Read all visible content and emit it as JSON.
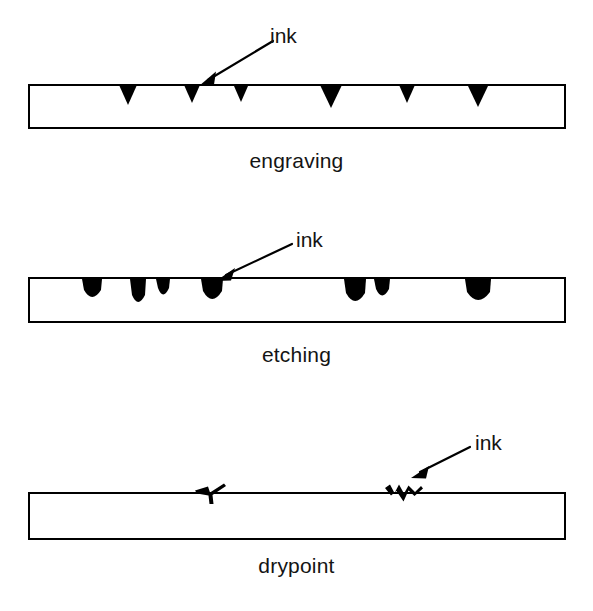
{
  "figure": {
    "background_color": "#ffffff",
    "line_color": "#000000",
    "ink_color": "#000000",
    "text_color": "#141414"
  },
  "panels": [
    {
      "id": "engraving",
      "caption": "engraving",
      "ink_label": "ink",
      "plate": {
        "x": 29,
        "y": 85,
        "width": 536,
        "height": 43,
        "stroke": 2
      },
      "mark_type": "v-groove",
      "mark_description": "sharp clean V-shaped incised grooves filled with ink",
      "marks": [
        {
          "cx": 128,
          "width": 17,
          "depth": 19
        },
        {
          "cx": 192,
          "width": 15,
          "depth": 17
        },
        {
          "cx": 241,
          "width": 14,
          "depth": 16
        },
        {
          "cx": 331,
          "width": 21,
          "depth": 22
        },
        {
          "cx": 407,
          "width": 15,
          "depth": 17
        },
        {
          "cx": 478,
          "width": 20,
          "depth": 21
        }
      ],
      "arrow": {
        "x1": 273,
        "y1": 41,
        "x2": 199,
        "y2": 86
      }
    },
    {
      "id": "etching",
      "caption": "etching",
      "ink_label": "ink",
      "plate": {
        "x": 29,
        "y": 78,
        "width": 536,
        "height": 44,
        "stroke": 2
      },
      "mark_type": "rounded-bite",
      "mark_description": "irregular rounded acid-bitten pits of varying width and depth filled with ink",
      "marks": [
        {
          "cx": 92,
          "width": 20,
          "depth": 23
        },
        {
          "cx": 138,
          "width": 16,
          "depth": 28
        },
        {
          "cx": 163,
          "width": 14,
          "depth": 20
        },
        {
          "cx": 212,
          "width": 22,
          "depth": 25
        },
        {
          "cx": 355,
          "width": 22,
          "depth": 27
        },
        {
          "cx": 382,
          "width": 16,
          "depth": 21
        },
        {
          "cx": 478,
          "width": 26,
          "depth": 26
        }
      ],
      "arrow": {
        "x1": 292,
        "y1": 44,
        "x2": 216,
        "y2": 81
      }
    },
    {
      "id": "drypoint",
      "caption": "drypoint",
      "ink_label": "ink",
      "plate": {
        "x": 29,
        "y": 93,
        "width": 536,
        "height": 46,
        "stroke": 2
      },
      "mark_type": "burr-scratch",
      "mark_description": "shallow scratched lines with raised ragged burr on either side holding ink",
      "marks": [
        {
          "cx": 211,
          "width": 34,
          "depth": 17
        },
        {
          "cx": 401,
          "width": 38,
          "depth": 19
        }
      ],
      "arrow": {
        "x1": 470,
        "y1": 47,
        "x2": 411,
        "y2": 78
      }
    }
  ]
}
